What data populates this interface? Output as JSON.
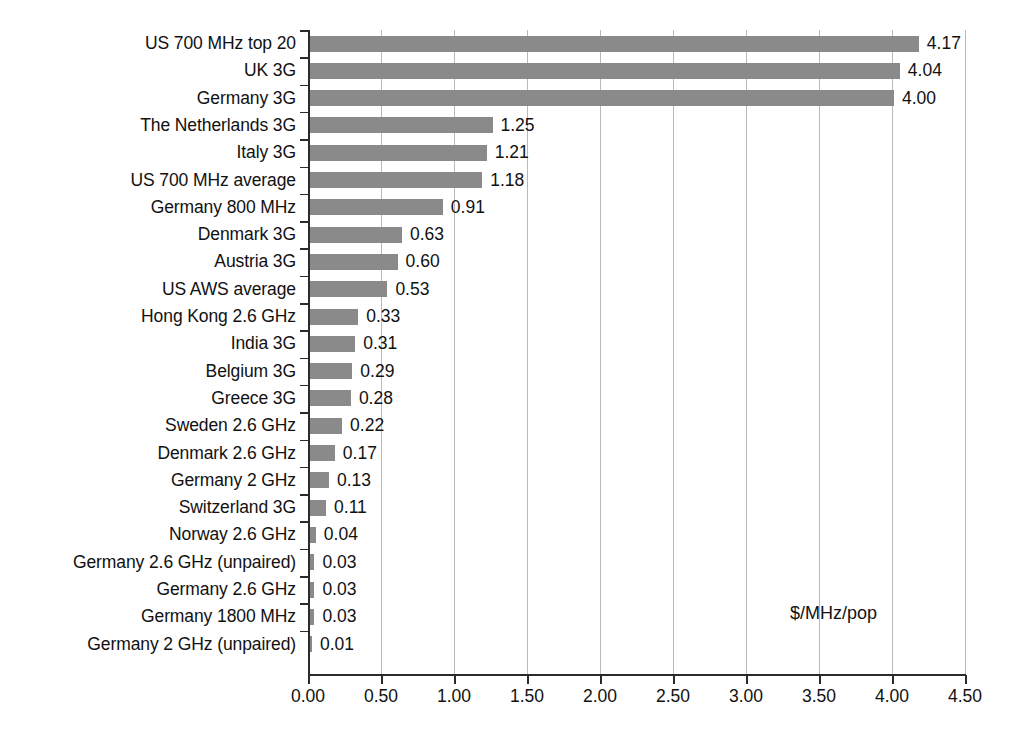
{
  "chart_data": {
    "type": "bar",
    "orientation": "horizontal",
    "title": "",
    "subtitle": "",
    "xlabel": "$/MHz/pop",
    "ylabel": "",
    "xlim": [
      0.0,
      4.5
    ],
    "grid": true,
    "legend": null,
    "value_labels": true,
    "annotations": [
      "$/MHz/pop"
    ],
    "xticks": [
      "0.00",
      "0.50",
      "1.00",
      "1.50",
      "2.00",
      "2.50",
      "3.00",
      "3.50",
      "4.00",
      "4.50"
    ],
    "xtick_values": [
      0.0,
      0.5,
      1.0,
      1.5,
      2.0,
      2.5,
      3.0,
      3.5,
      4.0,
      4.5
    ],
    "categories": [
      "US 700 MHz top 20",
      "UK 3G",
      "Germany 3G",
      "The Netherlands 3G",
      "Italy 3G",
      "US 700 MHz average",
      "Germany 800 MHz",
      "Denmark 3G",
      "Austria 3G",
      "US AWS average",
      "Hong Kong 2.6 GHz",
      "India 3G",
      "Belgium 3G",
      "Greece 3G",
      "Sweden 2.6 GHz",
      "Denmark 2.6 GHz",
      "Germany 2 GHz",
      "Switzerland 3G",
      "Norway 2.6 GHz",
      "Germany 2.6 GHz (unpaired)",
      "Germany 2.6 GHz",
      "Germany 1800 MHz",
      "Germany 2 GHz (unpaired)"
    ],
    "values": [
      4.17,
      4.04,
      4.0,
      1.25,
      1.21,
      1.18,
      0.91,
      0.63,
      0.6,
      0.53,
      0.33,
      0.31,
      0.29,
      0.28,
      0.22,
      0.17,
      0.13,
      0.11,
      0.04,
      0.03,
      0.03,
      0.03,
      0.01
    ],
    "value_label_texts": [
      "4.17",
      "4.04",
      "4.00",
      "1.25",
      "1.21",
      "1.18",
      "0.91",
      "0.63",
      "0.60",
      "0.53",
      "0.33",
      "0.31",
      "0.29",
      "0.28",
      "0.22",
      "0.17",
      "0.13",
      "0.11",
      "0.04",
      "0.03",
      "0.03",
      "0.03",
      "0.01"
    ],
    "colors": {
      "bar": "#8a8a8a",
      "axis": "#2b2b2b",
      "grid": "#b9b9b9",
      "text": "#111111",
      "background": "#ffffff"
    }
  }
}
